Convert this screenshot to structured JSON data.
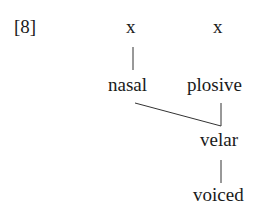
{
  "example_label": "[8]",
  "tiers": {
    "skeletal": [
      "x",
      "x"
    ],
    "features": {
      "nasal": "nasal",
      "plosive": "plosive",
      "velar": "velar",
      "voiced": "voiced"
    }
  },
  "colors": {
    "ink": "#1a1a1a",
    "background": "#ffffff"
  }
}
